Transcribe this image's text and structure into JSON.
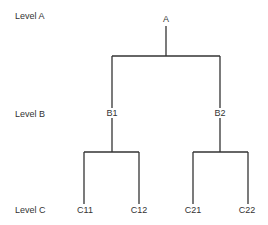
{
  "diagram": {
    "type": "tree",
    "levels": [
      {
        "label": "Level A",
        "nodes": [
          "A"
        ]
      },
      {
        "label": "Level B",
        "nodes": [
          "B1",
          "B2"
        ]
      },
      {
        "label": "Level C",
        "nodes": [
          "C11",
          "C12",
          "C21",
          "C22"
        ]
      }
    ],
    "edges": [
      [
        "A",
        "B1"
      ],
      [
        "A",
        "B2"
      ],
      [
        "B1",
        "C11"
      ],
      [
        "B1",
        "C12"
      ],
      [
        "B2",
        "C21"
      ],
      [
        "B2",
        "C22"
      ]
    ],
    "line_color": "#333333"
  },
  "level_labels": {
    "a": "Level A",
    "b": "Level B",
    "c": "Level C"
  },
  "nodes": {
    "a": "A",
    "b1": "B1",
    "b2": "B2",
    "c11": "C11",
    "c12": "C12",
    "c21": "C21",
    "c22": "C22"
  }
}
